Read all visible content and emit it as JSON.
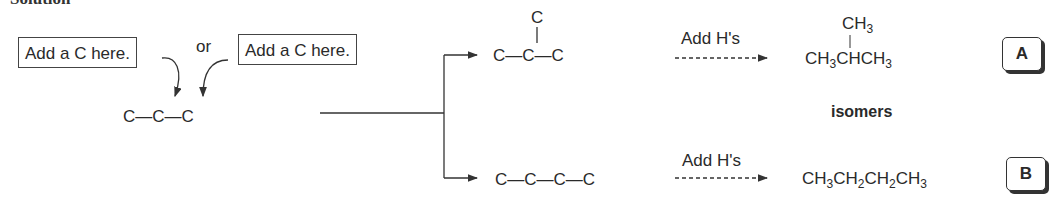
{
  "heading": "Solution",
  "left": {
    "hint_box_1": "Add a C here.",
    "hint_box_2": "Add a C here.",
    "or_label": "or",
    "propane_skeleton": [
      "C",
      "C",
      "C"
    ]
  },
  "branch_top": {
    "skeleton_top_c": "C",
    "skeleton_main": [
      "C",
      "C",
      "C"
    ],
    "step_label": "Add H's",
    "formula_top": {
      "base": "CH",
      "sub": "3"
    },
    "formula_main": [
      {
        "base": "CH",
        "sub": "3"
      },
      {
        "base": "CHCH",
        "sub": "3"
      }
    ],
    "label": "A"
  },
  "middle_label": "isomers",
  "branch_bottom": {
    "skeleton": [
      "C",
      "C",
      "C",
      "C"
    ],
    "step_label": "Add H's",
    "formula": [
      {
        "base": "CH",
        "sub": "3"
      },
      {
        "base": "CH",
        "sub": "2"
      },
      {
        "base": "CH",
        "sub": "2"
      },
      {
        "base": "CH",
        "sub": "3"
      }
    ],
    "label": "B"
  },
  "colors": {
    "ink": "#2a2a2a",
    "background": "#ffffff"
  }
}
